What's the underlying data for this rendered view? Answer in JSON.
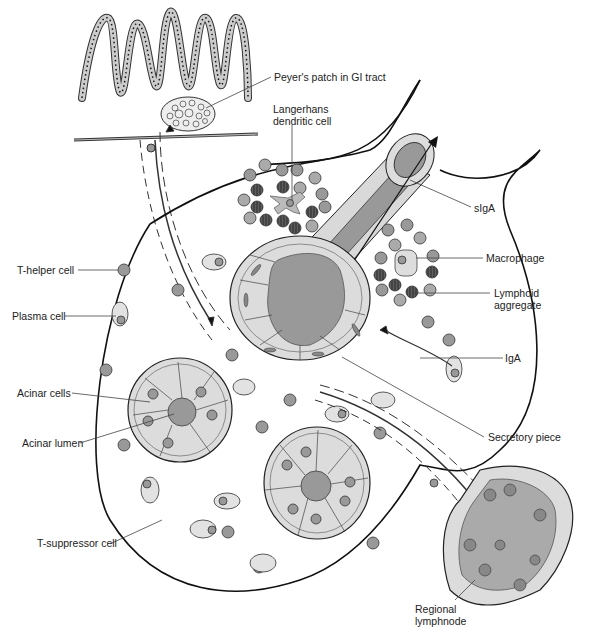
{
  "diagram": {
    "labels": {
      "peyers_patch": "Peyer's patch in GI tract",
      "langerhans": "Langerhans dendritic cell",
      "siga": "sIgA",
      "t_helper": "T-helper cell",
      "macrophage": "Macrophage",
      "lymphoid_aggregate_1": "Lymphoid",
      "lymphoid_aggregate_2": "aggregate",
      "plasma_cell": "Plasma cell",
      "iga": "IgA",
      "acinar_cells": "Acinar cells",
      "acinar_lumen": "Acinar lumen",
      "secretory_piece": "Secretory piece",
      "t_suppressor": "T-suppressor cell",
      "regional_lymphnode_1": "Regional",
      "regional_lymphnode_2": "lymphnode"
    },
    "colors": {
      "outline": "#1a1a1a",
      "cell_fill": "#d9d9d9",
      "lymphocyte": "#8c8c8c",
      "dark_cell": "#3a3a3a",
      "lumen": "#999999",
      "leader_line": "#555555"
    }
  }
}
